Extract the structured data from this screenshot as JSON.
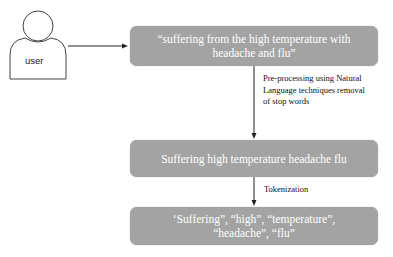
{
  "actor": {
    "label": "user"
  },
  "boxes": [
    {
      "text": "“suffering from the high temperature with headache and flu”"
    },
    {
      "text": "Suffering high temperature headache flu"
    },
    {
      "text": "‘Suffering”, “high”, “temperature”, “headache”, “flu”"
    }
  ],
  "edges": [
    {
      "label": "Pre-processing using Natural Language techniques removal of stop words"
    },
    {
      "label": "Tokenization"
    }
  ],
  "colors": {
    "box_fill": "#a3a3a3",
    "box_text": "#ffffff",
    "line": "#222222"
  }
}
